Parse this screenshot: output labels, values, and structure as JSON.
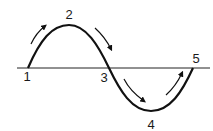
{
  "diagram": {
    "type": "sine-wave",
    "axis": {
      "y": 68,
      "x_start": 17,
      "x_end": 210
    },
    "points": [
      {
        "id": "1",
        "label": "1",
        "x": 28,
        "y": 68,
        "label_x": 27,
        "label_y": 76
      },
      {
        "id": "2",
        "label": "2",
        "x": 69,
        "y": 25,
        "label_x": 69,
        "label_y": 14
      },
      {
        "id": "3",
        "label": "3",
        "x": 109,
        "y": 68,
        "label_x": 104,
        "label_y": 77
      },
      {
        "id": "4",
        "label": "4",
        "x": 151,
        "y": 111,
        "label_x": 151,
        "label_y": 124
      },
      {
        "id": "5",
        "label": "5",
        "x": 193,
        "y": 68,
        "label_x": 196,
        "label_y": 58
      }
    ],
    "arrows": [
      {
        "name": "arrow-rising-1-2",
        "direction": "up-right"
      },
      {
        "name": "arrow-falling-2-3",
        "direction": "down-right"
      },
      {
        "name": "arrow-falling-3-4",
        "direction": "down-right"
      },
      {
        "name": "arrow-rising-4-5",
        "direction": "up-right"
      }
    ],
    "colors": {
      "stroke": "#111111",
      "background": "#ffffff"
    }
  }
}
